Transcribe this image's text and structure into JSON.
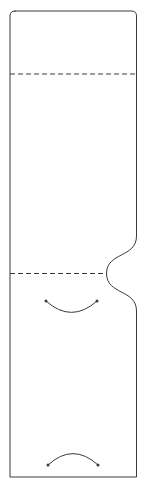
{
  "figure": {
    "title": "",
    "type": "technical-line-drawing",
    "canvas": {
      "width": 147,
      "height": 488
    },
    "background_color": "#ffffff",
    "stroke_color": "#3a3a3a",
    "stroke_width": 1,
    "dash_pattern": "5 3"
  },
  "geometry": {
    "outline": {
      "name": "panel-outline",
      "left": 10,
      "right": 136.5,
      "top": 11,
      "bottom": 477,
      "corner_radius_top_left": 5,
      "corner_radius_top_right": 5,
      "corner_radius_bottom_left": 0,
      "corner_radius_bottom_right": 0,
      "path": "M 15 11 L 131.5 11 Q 136.5 11 136.5 16 L 136.5 236 C 136.5 258 106.5 252 106.5 273.5 C 106.5 295 136.5 289 136.5 311 L 136.5 477 L 10 477 L 10 16 Q 10 11 15 11 Z"
    },
    "fold_lines": [
      {
        "name": "fold-line-upper",
        "orientation": "horizontal",
        "y": 74,
        "x_start": 10,
        "x_end": 136.5,
        "style": "dashed"
      },
      {
        "name": "fold-line-lower",
        "orientation": "horizontal",
        "y": 273.5,
        "x_start": 10,
        "x_end": 107,
        "style": "dashed"
      }
    ],
    "notch": {
      "name": "side-notch-curve",
      "side": "right",
      "type": "s-curve-concave",
      "y_start": 236,
      "y_pinch": 273.5,
      "y_end": 311,
      "x_edge": 136.5,
      "x_pinch": 106.5
    },
    "arcs": [
      {
        "name": "thumb-notch-arc-upper",
        "direction": "concave-up",
        "start": {
          "x": 46,
          "y": 301
        },
        "end": {
          "x": 97,
          "y": 301
        },
        "control": {
          "x": 71.5,
          "y": 324
        },
        "path": "M 46 301 Q 71.5 324 97 301",
        "endpoint_dots": true,
        "dot_radius": 1.5
      },
      {
        "name": "thumb-notch-arc-lower",
        "direction": "concave-down",
        "start": {
          "x": 48,
          "y": 465
        },
        "end": {
          "x": 98,
          "y": 465
        },
        "control": {
          "x": 73,
          "y": 442
        },
        "path": "M 48 465 Q 73 442 98 465",
        "endpoint_dots": true,
        "dot_radius": 1.5
      }
    ]
  },
  "panels": [
    {
      "name": "panel-top-flap",
      "label": "",
      "y_from": 11,
      "y_to": 74
    },
    {
      "name": "panel-body-main",
      "label": "",
      "y_from": 74,
      "y_to": 273.5
    },
    {
      "name": "panel-body-lower",
      "label": "",
      "y_from": 273.5,
      "y_to": 477
    }
  ]
}
